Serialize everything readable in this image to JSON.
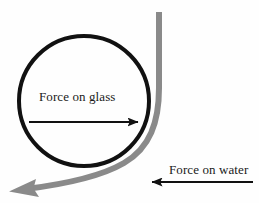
{
  "figure": {
    "title": "",
    "background_color": "#fefefe",
    "width": 259,
    "height": 203
  },
  "labels": {
    "force_on_glass": "Force on glass",
    "force_on_water": "Force on water"
  },
  "colors": {
    "glass_outline": "#111111",
    "water_stream": "#8a8a8a",
    "arrow_black": "#111111",
    "arrow_gray": "#8a8a8a",
    "background": "#fefefe"
  },
  "shapes": {
    "glass_circle": {
      "name": "glass-cylinder-circle",
      "center_x": 84,
      "center_y": 101,
      "radius": 66,
      "stroke_width": 4,
      "fill": "none"
    },
    "water_stream": {
      "name": "water-stream-curve",
      "stroke_width": 6,
      "description": "gray stream falling vertically then deflecting around the lower-right of the circle toward the lower left"
    },
    "force_on_glass_arrow": {
      "name": "force-on-glass-arrow",
      "x1": 29,
      "y1": 122,
      "x2": 140,
      "y2": 122,
      "direction": "right"
    },
    "force_on_water_arrow": {
      "name": "force-on-water-arrow",
      "x1": 253,
      "y1": 182,
      "x2": 150,
      "y2": 182,
      "direction": "left"
    }
  }
}
